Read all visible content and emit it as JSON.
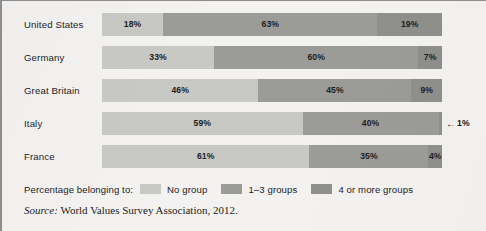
{
  "chart_data": {
    "type": "bar",
    "subtype": "stacked-horizontal-100",
    "title": "",
    "xlabel": "",
    "ylabel": "",
    "xlim": [
      0,
      100
    ],
    "grid": false,
    "legend_position": "bottom-left",
    "categories": [
      "United States",
      "Germany",
      "Great Britain",
      "Italy",
      "France"
    ],
    "series": [
      {
        "name": "No group",
        "color": "#c8c8c5",
        "values": [
          18,
          33,
          46,
          59,
          61
        ]
      },
      {
        "name": "1–3 groups",
        "color": "#9b9b98",
        "values": [
          63,
          60,
          45,
          40,
          35
        ]
      },
      {
        "name": "4 or more groups",
        "color": "#8f8f8c",
        "values": [
          19,
          7,
          9,
          1,
          4
        ]
      }
    ],
    "value_labels": [
      [
        "18%",
        "63%",
        "19%"
      ],
      [
        "33%",
        "60%",
        "7%"
      ],
      [
        "46%",
        "45%",
        "9%"
      ],
      [
        "59%",
        "40%",
        "1%"
      ],
      [
        "61%",
        "35%",
        "4%"
      ]
    ],
    "annotations": [
      {
        "row": "Italy",
        "series": "4 or more groups",
        "text": "1%",
        "arrow": "←",
        "style": "leader-arrow-right-of-bar"
      }
    ]
  },
  "rows": [
    {
      "label": "United States",
      "segments": [
        {
          "label": "18%",
          "value": 18,
          "group": "No group",
          "inline": true
        },
        {
          "label": "63%",
          "value": 63,
          "group": "1–3 groups",
          "inline": true
        },
        {
          "label": "19%",
          "value": 19,
          "group": "4 or more groups",
          "inline": true
        }
      ]
    },
    {
      "label": "Germany",
      "segments": [
        {
          "label": "33%",
          "value": 33,
          "group": "No group",
          "inline": true
        },
        {
          "label": "60%",
          "value": 60,
          "group": "1–3 groups",
          "inline": true
        },
        {
          "label": "7%",
          "value": 7,
          "group": "4 or more groups",
          "inline": true
        }
      ]
    },
    {
      "label": "Great Britain",
      "segments": [
        {
          "label": "46%",
          "value": 46,
          "group": "No group",
          "inline": true
        },
        {
          "label": "45%",
          "value": 45,
          "group": "1–3 groups",
          "inline": true
        },
        {
          "label": "9%",
          "value": 9,
          "group": "4 or more groups",
          "inline": true
        }
      ]
    },
    {
      "label": "Italy",
      "segments": [
        {
          "label": "59%",
          "value": 59,
          "group": "No group",
          "inline": true
        },
        {
          "label": "40%",
          "value": 40,
          "group": "1–3 groups",
          "inline": true
        },
        {
          "label": "1%",
          "value": 1,
          "group": "4 or more groups",
          "inline": false
        }
      ],
      "callout": {
        "arrow": "←",
        "text": "1%"
      }
    },
    {
      "label": "France",
      "segments": [
        {
          "label": "61%",
          "value": 61,
          "group": "No group",
          "inline": true
        },
        {
          "label": "35%",
          "value": 35,
          "group": "1–3 groups",
          "inline": true
        },
        {
          "label": "4%",
          "value": 4,
          "group": "4 or more groups",
          "inline": true
        }
      ]
    }
  ],
  "legend": {
    "title": "Percentage belonging to:",
    "items": [
      {
        "label": "No group",
        "color": "#c8c8c5"
      },
      {
        "label": "1–3 groups",
        "color": "#9b9b98"
      },
      {
        "label": "4 or more groups",
        "color": "#8f8f8c"
      }
    ]
  },
  "source": {
    "label": "Source:",
    "text": "World Values Survey Association, 2012."
  },
  "colors": {
    "background": "#f3f2f0",
    "border": "#8d8d8d",
    "text": "#23232a",
    "segment_light": "#c8c8c5",
    "segment_medium": "#9b9b98",
    "segment_dark": "#8f8f8c"
  }
}
